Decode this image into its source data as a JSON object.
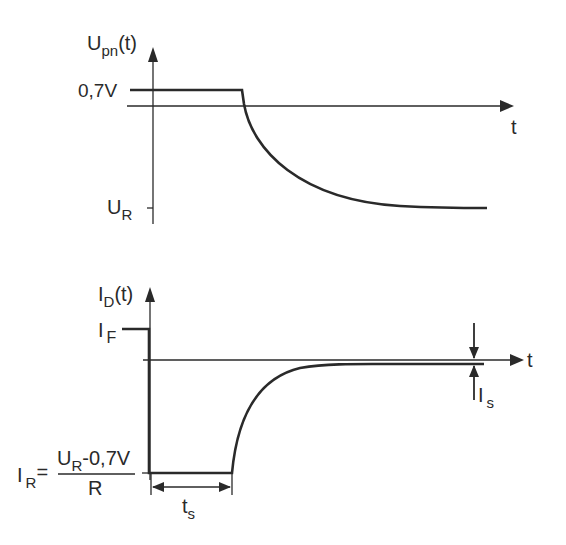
{
  "diagram": {
    "top_plot": {
      "y_axis_label": {
        "main": "U",
        "sub": "pn",
        "suffix": "(t)"
      },
      "x_axis_label": "t",
      "level_high_label": "0,7V",
      "level_low_label": {
        "main": "U",
        "sub": "R"
      }
    },
    "bottom_plot": {
      "y_axis_label": {
        "main": "I",
        "sub": "D",
        "suffix": "(t)"
      },
      "x_axis_label": "t",
      "forward_current_label": {
        "main": "I",
        "sub": "F"
      },
      "reverse_current_label": {
        "main": "I",
        "sub": "R",
        "eq": "="
      },
      "reverse_current_formula": {
        "num_main": "U",
        "num_sub": "R",
        "num_rest": "-0,7V",
        "den": "R"
      },
      "storage_time_label": {
        "main": "t",
        "sub": "s"
      },
      "saturation_current_label": {
        "main": "I",
        "sub": "s"
      }
    },
    "colors": {
      "line": "#2a2a2a",
      "background": "#ffffff"
    }
  }
}
